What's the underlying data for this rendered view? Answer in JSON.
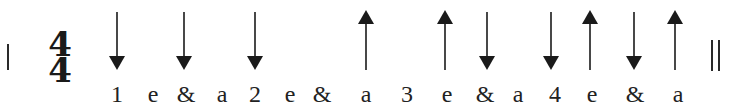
{
  "notation": {
    "time_signature": {
      "top": "4",
      "bottom": "4"
    },
    "start_barline": "single",
    "end_barline": "double",
    "colors": {
      "ink": "#1a1a1a",
      "background": "#ffffff"
    }
  },
  "strokes": [
    {
      "x": 117,
      "direction": "down"
    },
    {
      "x": 184,
      "direction": "down"
    },
    {
      "x": 255,
      "direction": "down"
    },
    {
      "x": 366,
      "direction": "up"
    },
    {
      "x": 445,
      "direction": "up"
    },
    {
      "x": 487,
      "direction": "down"
    },
    {
      "x": 551,
      "direction": "down"
    },
    {
      "x": 590,
      "direction": "up"
    },
    {
      "x": 634,
      "direction": "down"
    },
    {
      "x": 675,
      "direction": "up"
    }
  ],
  "counts": [
    {
      "x": 117,
      "text": "1"
    },
    {
      "x": 153,
      "text": "e"
    },
    {
      "x": 186,
      "text": "&"
    },
    {
      "x": 222,
      "text": "a"
    },
    {
      "x": 255,
      "text": "2"
    },
    {
      "x": 290,
      "text": "e"
    },
    {
      "x": 322,
      "text": "&"
    },
    {
      "x": 366,
      "text": "a"
    },
    {
      "x": 407,
      "text": "3"
    },
    {
      "x": 447,
      "text": "e"
    },
    {
      "x": 485,
      "text": "&"
    },
    {
      "x": 518,
      "text": "a"
    },
    {
      "x": 555,
      "text": "4"
    },
    {
      "x": 592,
      "text": "e"
    },
    {
      "x": 635,
      "text": "&"
    },
    {
      "x": 678,
      "text": "a"
    }
  ]
}
